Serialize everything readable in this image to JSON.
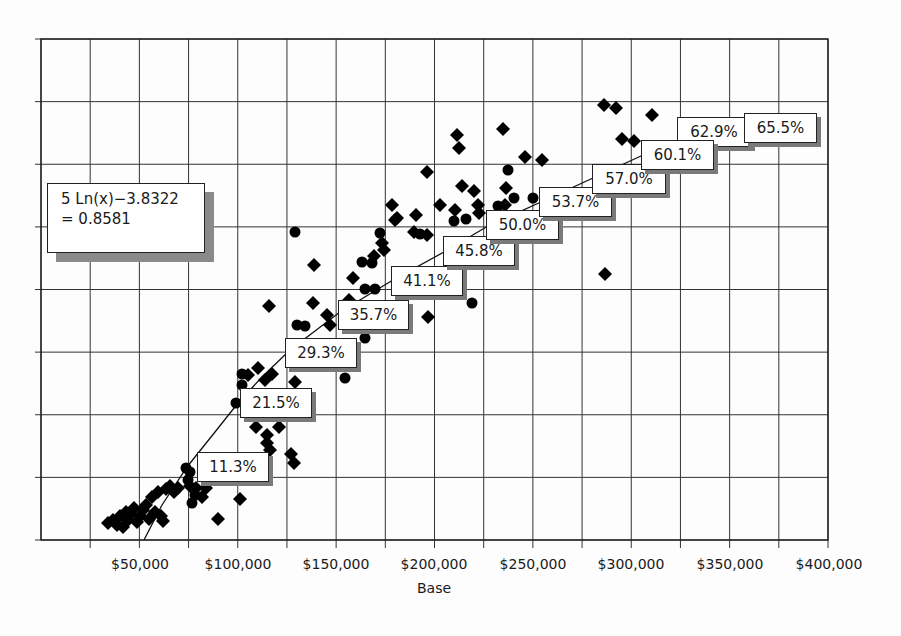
{
  "chart_data": {
    "type": "scatter",
    "title": "",
    "xlabel": "Base",
    "ylabel": "",
    "xlim": [
      0,
      400000
    ],
    "x_ticks": [
      "$50,000",
      "$100,000",
      "$150,000",
      "$200,000",
      "$250,000",
      "$300,000",
      "$350,000",
      "$400,000"
    ],
    "x_tick_values": [
      50000,
      100000,
      150000,
      200000,
      250000,
      300000,
      350000,
      400000
    ],
    "grid": true,
    "y_gridlines": 8,
    "x_gridlines": 16,
    "legend": "none",
    "trendline": {
      "type": "logarithmic",
      "equation_text": "5 Ln(x)−3.8322",
      "r2_text": "= 0.8581"
    },
    "data_labels": [
      {
        "base": 85000,
        "label": "11.3%"
      },
      {
        "base": 100000,
        "label": "21.5%"
      },
      {
        "base": 125000,
        "label": "29.3%"
      },
      {
        "base": 150000,
        "label": "35.7%"
      },
      {
        "base": 175000,
        "label": "41.1%"
      },
      {
        "base": 200000,
        "label": "45.8%"
      },
      {
        "base": 225000,
        "label": "50.0%"
      },
      {
        "base": 250000,
        "label": "53.7%"
      },
      {
        "base": 275000,
        "label": "57.0%"
      },
      {
        "base": 300000,
        "label": "60.1%"
      },
      {
        "base": 325000,
        "label": "62.9%"
      },
      {
        "base": 350000,
        "label": "65.5%"
      }
    ],
    "series": [
      {
        "name": "diamonds",
        "marker": "diamond",
        "points_px": [
          [
            108,
            523
          ],
          [
            113,
            520
          ],
          [
            117,
            525
          ],
          [
            120,
            516
          ],
          [
            123,
            527
          ],
          [
            126,
            512
          ],
          [
            128,
            520
          ],
          [
            131,
            514
          ],
          [
            134,
            508
          ],
          [
            137,
            522
          ],
          [
            140,
            516
          ],
          [
            143,
            510
          ],
          [
            146,
            505
          ],
          [
            149,
            519
          ],
          [
            152,
            497
          ],
          [
            155,
            512
          ],
          [
            158,
            492
          ],
          [
            161,
            516
          ],
          [
            163,
            521
          ],
          [
            166,
            489
          ],
          [
            170,
            486
          ],
          [
            174,
            492
          ],
          [
            178,
            488
          ],
          [
            190,
            486
          ],
          [
            196,
            488
          ],
          [
            202,
            497
          ],
          [
            206,
            488
          ],
          [
            218,
            519
          ],
          [
            240,
            499
          ],
          [
            256,
            427
          ],
          [
            267,
            435
          ],
          [
            279,
            427
          ],
          [
            267,
            443
          ],
          [
            270,
            450
          ],
          [
            291,
            454
          ],
          [
            294,
            463
          ],
          [
            248,
            375
          ],
          [
            258,
            368
          ],
          [
            265,
            380
          ],
          [
            272,
            374
          ],
          [
            295,
            382
          ],
          [
            269,
            306
          ],
          [
            313,
            303
          ],
          [
            314,
            265
          ],
          [
            327,
            315
          ],
          [
            330,
            325
          ],
          [
            349,
            300
          ],
          [
            353,
            278
          ],
          [
            374,
            256
          ],
          [
            382,
            243
          ],
          [
            384,
            250
          ],
          [
            395,
            220
          ],
          [
            397,
            218
          ],
          [
            414,
            232
          ],
          [
            427,
            235
          ],
          [
            416,
            215
          ],
          [
            428,
            317
          ],
          [
            392,
            205
          ],
          [
            427,
            172
          ],
          [
            440,
            205
          ],
          [
            455,
            210
          ],
          [
            457,
            135
          ],
          [
            459,
            148
          ],
          [
            462,
            186
          ],
          [
            474,
            191
          ],
          [
            478,
            205
          ],
          [
            479,
            213
          ],
          [
            503,
            129
          ],
          [
            505,
            205
          ],
          [
            506,
            188
          ],
          [
            525,
            157
          ],
          [
            542,
            160
          ],
          [
            604,
            105
          ],
          [
            616,
            108
          ],
          [
            652,
            115
          ],
          [
            622,
            139
          ],
          [
            634,
            141
          ],
          [
            605,
            274
          ]
        ]
      },
      {
        "name": "circles",
        "marker": "circle",
        "points_px": [
          [
            186,
            468
          ],
          [
            190,
            472
          ],
          [
            188,
            480
          ],
          [
            195,
            495
          ],
          [
            192,
            503
          ],
          [
            242,
            374
          ],
          [
            242,
            385
          ],
          [
            236,
            403
          ],
          [
            295,
            232
          ],
          [
            297,
            325
          ],
          [
            305,
            326
          ],
          [
            362,
            262
          ],
          [
            372,
            263
          ],
          [
            365,
            289
          ],
          [
            375,
            289
          ],
          [
            380,
            233
          ],
          [
            420,
            234
          ],
          [
            365,
            338
          ],
          [
            345,
            378
          ],
          [
            454,
            221
          ],
          [
            466,
            219
          ],
          [
            472,
            303
          ],
          [
            498,
            206
          ],
          [
            508,
            170
          ],
          [
            514,
            198
          ],
          [
            533,
            198
          ]
        ]
      }
    ]
  },
  "equation_box": {
    "line1": "5 Ln(x)−3.8322",
    "line2": "= 0.8581"
  },
  "axis": {
    "x_title": "Base",
    "x_ticks": [
      "$50,000",
      "$100,000",
      "$150,000",
      "$200,000",
      "$250,000",
      "$300,000",
      "$350,000",
      "$400,000"
    ]
  },
  "labels": [
    "11.3%",
    "21.5%",
    "29.3%",
    "35.7%",
    "41.1%",
    "45.8%",
    "50.0%",
    "53.7%",
    "57.0%",
    "60.1%",
    "62.9%",
    "65.5%"
  ]
}
